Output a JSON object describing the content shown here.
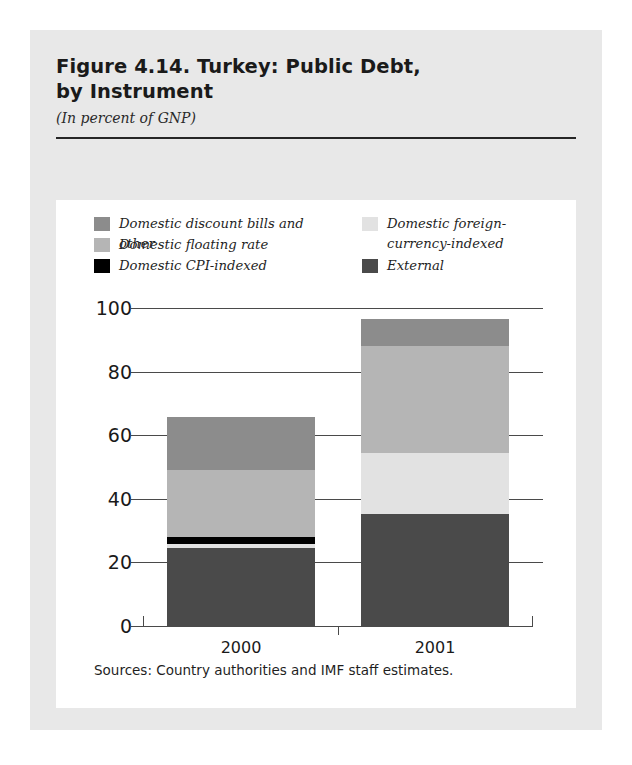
{
  "figure": {
    "title_line1": "Figure 4.14. Turkey: Public Debt,",
    "title_line2": "by Instrument",
    "subtitle": "(In percent of GNP)",
    "source": "Sources: Country authorities and IMF staff estimates."
  },
  "legend": {
    "left": [
      {
        "label": "Domestic discount bills and other",
        "color": "#8c8c8c",
        "key": "discount_bills"
      },
      {
        "label": "Domestic floating rate",
        "color": "#b5b5b5",
        "key": "floating_rate"
      },
      {
        "label": "Domestic CPI-indexed",
        "color": "#000000",
        "key": "cpi_indexed"
      }
    ],
    "right": [
      {
        "label": "Domestic foreign-\ncurrency-indexed",
        "color": "#e2e2e2",
        "key": "fx_indexed"
      },
      {
        "label": "External",
        "color": "#4a4a4a",
        "key": "external"
      }
    ]
  },
  "chart_data": {
    "type": "bar",
    "subtype": "stacked",
    "title": "Figure 4.14. Turkey: Public Debt, by Instrument",
    "subtitle": "(In percent of GNP)",
    "xlabel": "",
    "ylabel": "",
    "ylim": [
      0,
      100
    ],
    "yticks": [
      0,
      20,
      40,
      60,
      80,
      100
    ],
    "ytick_labels": [
      "0",
      "20",
      "40",
      "60",
      "80",
      "100"
    ],
    "grid": true,
    "legend_position": "top",
    "categories": [
      "2000",
      "2001"
    ],
    "series": [
      {
        "name": "External",
        "color": "#4a4a4a",
        "values": [
          24.5,
          35.2
        ]
      },
      {
        "name": "Domestic foreign-currency-indexed",
        "color": "#e2e2e2",
        "values": [
          1.3,
          19.2
        ]
      },
      {
        "name": "Domestic CPI-indexed",
        "color": "#000000",
        "values": [
          2.2,
          0.0
        ]
      },
      {
        "name": "Domestic floating rate",
        "color": "#b5b5b5",
        "values": [
          21.0,
          33.6
        ]
      },
      {
        "name": "Domestic discount bills and other",
        "color": "#8c8c8c",
        "values": [
          16.7,
          8.5
        ]
      }
    ],
    "totals": [
      65.7,
      96.5
    ]
  }
}
